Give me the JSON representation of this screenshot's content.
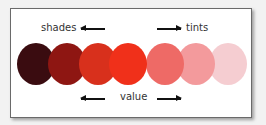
{
  "labels": {
    "shades": "shades",
    "tints": "tints",
    "value": "value"
  },
  "swatches": [
    {
      "name": "darkest-shade",
      "color": "#3a0c10"
    },
    {
      "name": "dark-shade",
      "color": "#8e1612"
    },
    {
      "name": "medium-shade",
      "color": "#d8301c"
    },
    {
      "name": "base-hue",
      "color": "#f0301a"
    },
    {
      "name": "light-tint",
      "color": "#ee6a66"
    },
    {
      "name": "lighter-tint",
      "color": "#f39a9c"
    },
    {
      "name": "lightest-tint",
      "color": "#f5cdd1"
    }
  ]
}
